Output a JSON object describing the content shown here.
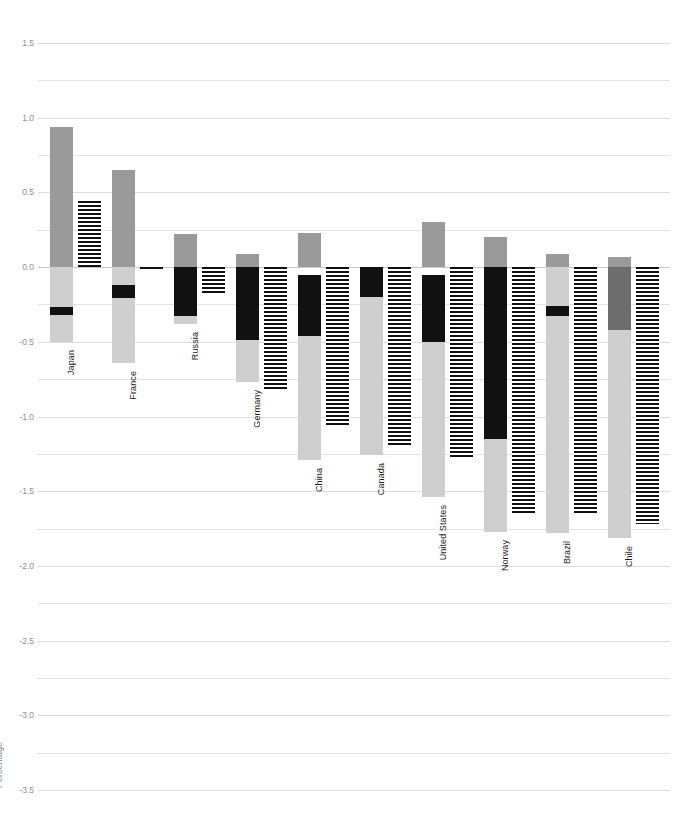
{
  "chart_data": {
    "type": "bar",
    "title": "",
    "subtitle": "",
    "xlabel": "",
    "ylabel": "Percentage",
    "ylim": [
      -3.5,
      1.5
    ],
    "ytick_step": 0.5,
    "gridline_step": 0.25,
    "grid": true,
    "legend": null,
    "orientation": "vertical",
    "stacked": true,
    "categories": [
      "Japan",
      "France",
      "Russia",
      "Germany",
      "China",
      "Canada",
      "United States",
      "Norway",
      "Brazil",
      "Chile"
    ],
    "ytick_labels": [
      "1.5",
      "1.0",
      "0.5",
      "0.0",
      "-0.5",
      "-1.0",
      "-1.5",
      "-2.0",
      "-2.5",
      "-3.0",
      "-3.5"
    ],
    "ytick_values": [
      1.5,
      1.0,
      0.5,
      0.0,
      -0.5,
      -1.0,
      -1.5,
      -2.0,
      -2.5,
      -3.0,
      -3.5
    ],
    "series": [
      {
        "name": "positive-contribution",
        "color": "#9a9a9a",
        "values": [
          0.94,
          0.65,
          0.22,
          0.09,
          0.23,
          0.0,
          0.3,
          0.2,
          0.09,
          0.07
        ]
      },
      {
        "name": "negative-dark",
        "color": "#111111",
        "values": [
          0.0,
          -0.13,
          -0.35,
          -0.49,
          -0.46,
          -0.2,
          -0.05,
          -1.15,
          -0.29,
          0.0
        ]
      },
      {
        "name": "negative-mid",
        "color": "#6d6d6d",
        "values": [
          0.0,
          0.0,
          0.0,
          0.0,
          0.0,
          0.0,
          0.0,
          0.0,
          0.0,
          -0.42
        ]
      },
      {
        "name": "negative-light",
        "color": "#cfcfcf",
        "values": [
          -0.5,
          -0.64,
          0.0,
          -0.77,
          -1.29,
          -1.26,
          -1.54,
          -1.77,
          -1.78,
          -1.81
        ]
      },
      {
        "name": "net-total",
        "color": "#111111",
        "pattern": "horizontal-hatch",
        "values": [
          0.44,
          -0.02,
          -0.18,
          -0.83,
          -1.07,
          -1.2,
          -1.27,
          -1.65,
          -1.65,
          -1.72
        ]
      }
    ],
    "stack_details": [
      {
        "category": "Japan",
        "pos_top": 0.94,
        "segments": [
          {
            "kind": "positive",
            "from": 0.0,
            "to": 0.94,
            "color": "#9a9a9a"
          },
          {
            "kind": "negative-light",
            "from": 0.0,
            "to": -0.27,
            "color": "#cfcfcf"
          },
          {
            "kind": "negative-dark",
            "from": -0.27,
            "to": -0.32,
            "color": "#111111"
          },
          {
            "kind": "negative-light",
            "from": -0.32,
            "to": -0.5,
            "color": "#cfcfcf"
          }
        ],
        "net": 0.44
      },
      {
        "category": "France",
        "pos_top": 0.65,
        "segments": [
          {
            "kind": "positive",
            "from": 0.0,
            "to": 0.65,
            "color": "#9a9a9a"
          },
          {
            "kind": "negative-light",
            "from": 0.0,
            "to": -0.12,
            "color": "#cfcfcf"
          },
          {
            "kind": "negative-dark",
            "from": -0.12,
            "to": -0.21,
            "color": "#111111"
          },
          {
            "kind": "negative-light",
            "from": -0.21,
            "to": -0.64,
            "color": "#cfcfcf"
          }
        ],
        "net": -0.02
      },
      {
        "category": "Russia",
        "pos_top": 0.22,
        "segments": [
          {
            "kind": "positive",
            "from": 0.0,
            "to": 0.22,
            "color": "#9a9a9a"
          },
          {
            "kind": "negative-dark",
            "from": 0.0,
            "to": -0.33,
            "color": "#111111"
          },
          {
            "kind": "negative-light",
            "from": -0.33,
            "to": -0.38,
            "color": "#cfcfcf"
          }
        ],
        "net": -0.18
      },
      {
        "category": "Germany",
        "pos_top": 0.09,
        "segments": [
          {
            "kind": "positive",
            "from": 0.0,
            "to": 0.09,
            "color": "#9a9a9a"
          },
          {
            "kind": "negative-dark",
            "from": 0.0,
            "to": -0.49,
            "color": "#111111"
          },
          {
            "kind": "negative-light",
            "from": -0.49,
            "to": -0.77,
            "color": "#cfcfcf"
          }
        ],
        "net": -0.83
      },
      {
        "category": "China",
        "pos_top": 0.23,
        "segments": [
          {
            "kind": "positive",
            "from": 0.0,
            "to": 0.23,
            "color": "#9a9a9a"
          },
          {
            "kind": "negative-dark",
            "from": -0.05,
            "to": -0.46,
            "color": "#111111"
          },
          {
            "kind": "negative-light",
            "from": -0.46,
            "to": -1.29,
            "color": "#cfcfcf"
          }
        ],
        "net": -1.07
      },
      {
        "category": "Canada",
        "pos_top": 0.0,
        "segments": [
          {
            "kind": "negative-dark",
            "from": 0.0,
            "to": -0.2,
            "color": "#111111"
          },
          {
            "kind": "negative-light",
            "from": -0.2,
            "to": -1.26,
            "color": "#cfcfcf"
          }
        ],
        "net": -1.2
      },
      {
        "category": "United States",
        "pos_top": 0.3,
        "segments": [
          {
            "kind": "positive",
            "from": 0.0,
            "to": 0.3,
            "color": "#9a9a9a"
          },
          {
            "kind": "negative-dark",
            "from": -0.05,
            "to": -0.5,
            "color": "#111111"
          },
          {
            "kind": "negative-light",
            "from": -0.5,
            "to": -1.54,
            "color": "#cfcfcf"
          }
        ],
        "net": -1.27
      },
      {
        "category": "Norway",
        "pos_top": 0.2,
        "segments": [
          {
            "kind": "positive",
            "from": 0.0,
            "to": 0.2,
            "color": "#9a9a9a"
          },
          {
            "kind": "negative-dark",
            "from": 0.0,
            "to": -1.15,
            "color": "#111111"
          },
          {
            "kind": "negative-light",
            "from": -1.15,
            "to": -1.77,
            "color": "#cfcfcf"
          }
        ],
        "net": -1.65
      },
      {
        "category": "Brazil",
        "pos_top": 0.09,
        "segments": [
          {
            "kind": "positive",
            "from": 0.0,
            "to": 0.09,
            "color": "#9a9a9a"
          },
          {
            "kind": "negative-light",
            "from": 0.0,
            "to": -0.26,
            "color": "#cfcfcf"
          },
          {
            "kind": "negative-dark",
            "from": -0.26,
            "to": -0.33,
            "color": "#111111"
          },
          {
            "kind": "negative-light",
            "from": -0.33,
            "to": -1.78,
            "color": "#cfcfcf"
          }
        ],
        "net": -1.65
      },
      {
        "category": "Chile",
        "pos_top": 0.07,
        "segments": [
          {
            "kind": "positive",
            "from": 0.0,
            "to": 0.07,
            "color": "#9a9a9a"
          },
          {
            "kind": "negative-mid",
            "from": 0.0,
            "to": -0.42,
            "color": "#6d6d6d"
          },
          {
            "kind": "negative-light",
            "from": -0.42,
            "to": -1.81,
            "color": "#cfcfcf"
          }
        ],
        "net": -1.72
      }
    ]
  },
  "colors": {
    "positive": "#9a9a9a",
    "negative_dark": "#111111",
    "negative_mid": "#6d6d6d",
    "negative_light": "#cfcfcf",
    "grid": "#e3e3e3",
    "tick_text": "#909090",
    "category_text": "#1d1d1d",
    "background": "#ffffff"
  }
}
